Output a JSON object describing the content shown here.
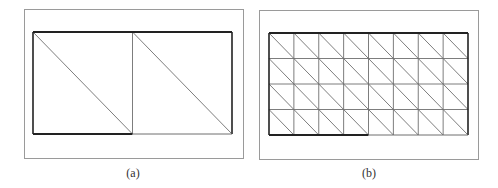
{
  "figures": [
    {
      "id": "a",
      "caption": "(a)",
      "description": "Rectangle split into 2 squares, each with one diagonal",
      "grid": {
        "cols": 2,
        "rows": 1
      },
      "frame": {
        "x": 24,
        "y": 9,
        "w": 219,
        "h": 149
      },
      "mesh": {
        "x": 33,
        "y": 32,
        "w": 199,
        "h": 102
      },
      "bold_bottom_cols": 1
    },
    {
      "id": "b",
      "caption": "(b)",
      "description": "Rectangle meshed into 8x4 squares, each with one diagonal",
      "grid": {
        "cols": 8,
        "rows": 4
      },
      "frame": {
        "x": 259,
        "y": 10,
        "w": 219,
        "h": 149
      },
      "mesh": {
        "x": 269,
        "y": 33,
        "w": 199,
        "h": 102
      },
      "bold_bottom_cols": 4
    }
  ],
  "colors": {
    "frame": "#9a9a9a",
    "bold": "#222222",
    "thin": "#6e6e6e"
  }
}
